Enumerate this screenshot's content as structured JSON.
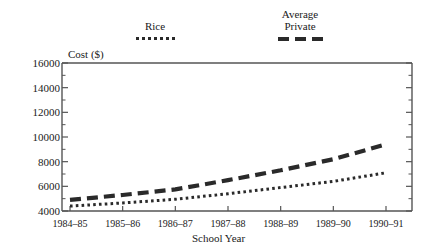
{
  "chart_data": {
    "type": "line",
    "title": "",
    "xlabel": "School Year",
    "ylabel": "Cost ($)",
    "categories": [
      "1984–85",
      "1985–86",
      "1986–87",
      "1987–88",
      "1988–89",
      "1989–90",
      "1990–91"
    ],
    "ylim": [
      4000,
      16000
    ],
    "ytick_labels": [
      "16000",
      "14000",
      "12000",
      "10000",
      "8000",
      "6000",
      "4000"
    ],
    "ytick_values": [
      16000,
      14000,
      12000,
      10000,
      8000,
      6000,
      4000
    ],
    "minor_tick_step": 1000,
    "grid": false,
    "legend_position": "above-plot",
    "series": [
      {
        "name": "Rice",
        "style": "dotted",
        "color": "#2a2a2a",
        "values": [
          4400,
          4650,
          4950,
          5400,
          5900,
          6400,
          7100
        ]
      },
      {
        "name": "Average Private",
        "style": "dashed",
        "color": "#2a2a2a",
        "values": [
          4900,
          5300,
          5750,
          6500,
          7300,
          8200,
          9400
        ]
      }
    ]
  },
  "legend": {
    "rice_label": "Rice",
    "private_label_line1": "Average",
    "private_label_line2": "Private"
  },
  "axes": {
    "y_title": "Cost ($)",
    "x_title": "School Year"
  }
}
